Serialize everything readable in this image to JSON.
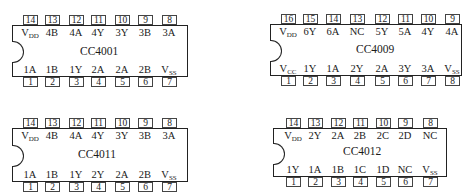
{
  "chips": [
    {
      "name": "CC4001",
      "top_pins": [
        "14",
        "13",
        "12",
        "11",
        "10",
        "9",
        "8"
      ],
      "top_labels": [
        "V_DD",
        "4B",
        "4A",
        "4Y",
        "3Y",
        "3B",
        "3A"
      ],
      "bottom_pins": [
        "1",
        "2",
        "3",
        "4",
        "5",
        "6",
        "7"
      ],
      "bottom_labels": [
        "1A",
        "1B",
        "1Y",
        "2A",
        "2A",
        "2B",
        "V_SS"
      ]
    },
    {
      "name": "CC4009",
      "top_pins": [
        "16",
        "15",
        "14",
        "13",
        "12",
        "11",
        "10",
        "9"
      ],
      "top_labels": [
        "V_DD",
        "6Y",
        "6A",
        "NC",
        "5Y",
        "5A",
        "4Y",
        "4A"
      ],
      "bottom_pins": [
        "1",
        "2",
        "3",
        "4",
        "5",
        "6",
        "7",
        "8"
      ],
      "bottom_labels": [
        "V_CC",
        "1Y",
        "1A",
        "2Y",
        "2A",
        "3Y",
        "3A",
        "V_SS"
      ]
    },
    {
      "name": "CC4011",
      "top_pins": [
        "14",
        "13",
        "12",
        "11",
        "10",
        "9",
        "8"
      ],
      "top_labels": [
        "V_DD",
        "4B",
        "4A",
        "4Y",
        "3Y",
        "3B",
        "3A"
      ],
      "bottom_pins": [
        "1",
        "2",
        "3",
        "4",
        "5",
        "6",
        "7"
      ],
      "bottom_labels": [
        "1A",
        "1B",
        "1Y",
        "2Y",
        "2A",
        "2B",
        "V_SS"
      ]
    },
    {
      "name": "CC4012",
      "top_pins": [
        "14",
        "13",
        "12",
        "11",
        "10",
        "9",
        "8"
      ],
      "top_labels": [
        "V_DD",
        "2Y",
        "2A",
        "2B",
        "2C",
        "2D",
        "NC"
      ],
      "bottom_pins": [
        "1",
        "2",
        "3",
        "4",
        "5",
        "6",
        "7"
      ],
      "bottom_labels": [
        "1Y",
        "1A",
        "1B",
        "1C",
        "1D",
        "NC",
        "V_SS"
      ]
    }
  ]
}
